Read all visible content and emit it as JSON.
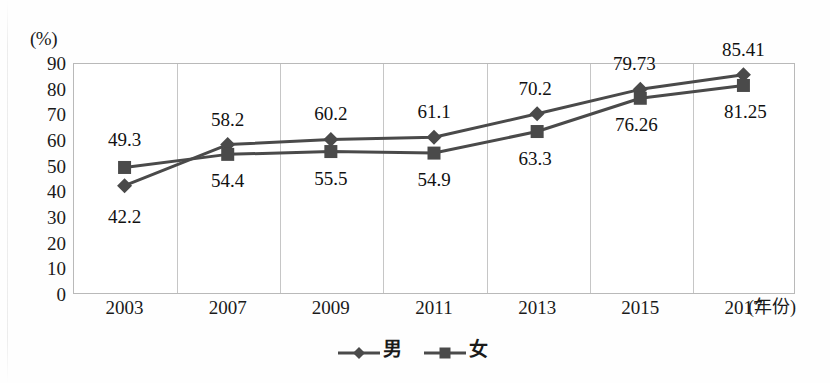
{
  "chart_data": {
    "type": "line",
    "title": "",
    "xlabel": "(年份)",
    "ylabel": "(%)",
    "categories": [
      "2003",
      "2007",
      "2009",
      "2011",
      "2013",
      "2015",
      "2017"
    ],
    "yticks": [
      90,
      80,
      70,
      60,
      50,
      40,
      30,
      20,
      10,
      0
    ],
    "ylim": [
      0,
      90
    ],
    "grid": "vertical",
    "legend_position": "bottom-center",
    "series": [
      {
        "name": "男",
        "marker": "diamond",
        "color": "#4a4a4a",
        "values": [
          42.2,
          58.2,
          60.2,
          61.1,
          70.2,
          79.73,
          85.41
        ],
        "labels": [
          "42.2",
          "58.2",
          "60.2",
          "61.1",
          "70.2",
          "79.73",
          "85.41"
        ]
      },
      {
        "name": "女",
        "marker": "square",
        "color": "#4a4a4a",
        "values": [
          49.3,
          54.4,
          55.5,
          54.9,
          63.3,
          76.26,
          81.25
        ],
        "labels": [
          "49.3",
          "54.4",
          "55.5",
          "54.9",
          "63.3",
          "76.26",
          "81.25"
        ]
      }
    ]
  },
  "legend": {
    "items": [
      {
        "label": "男",
        "marker": "diamond-marker-icon"
      },
      {
        "label": "女",
        "marker": "square-marker-icon"
      }
    ]
  },
  "colors": {
    "series": "#4a4a4a",
    "grid": "#c6c6c6",
    "frame": "#b9b9b9",
    "text": "#1a1a1a"
  }
}
